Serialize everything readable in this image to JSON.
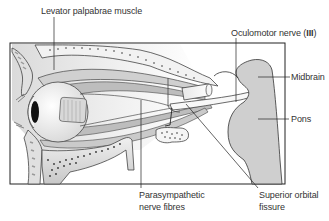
{
  "diagram": {
    "labels": {
      "levator": "Levator palpabrae muscle",
      "oculomotor_prefix": "Oculomotor nerve (",
      "oculomotor_numeral": "III",
      "oculomotor_suffix": ")",
      "midbrain": "Midbrain",
      "pons": "Pons",
      "parasympathetic_line1": "Parasympathetic",
      "parasympathetic_line2": "nerve fibres",
      "superior_orbital_line1": "Superior orbital",
      "superior_orbital_line2": "fissure"
    },
    "colors": {
      "brainstem_fill": "#cfcfcf",
      "line": "#333333",
      "frame": "#222222"
    }
  }
}
